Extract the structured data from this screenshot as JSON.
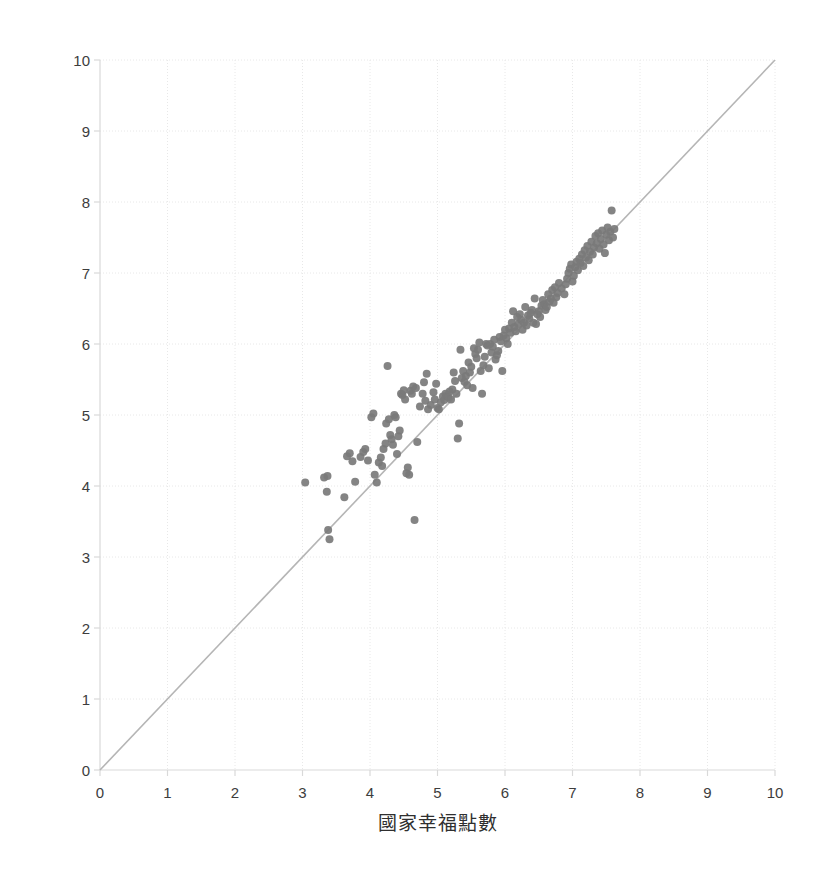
{
  "chart_data": {
    "type": "scatter",
    "title": "",
    "xlabel": "國家幸福點數",
    "ylabel": "都市幸福點數",
    "xlim": [
      0,
      10
    ],
    "ylim": [
      0,
      10
    ],
    "xticks": [
      "0",
      "1",
      "2",
      "3",
      "4",
      "5",
      "6",
      "7",
      "8",
      "9",
      "10"
    ],
    "yticks": [
      "0",
      "1",
      "2",
      "3",
      "4",
      "5",
      "6",
      "7",
      "8",
      "9",
      "10"
    ],
    "grid": true,
    "legend": null,
    "marker_color": "#7a7a7a",
    "marker_size": 8,
    "gridline_color": "#e8e8e8",
    "axis_color": "#d9d9d9",
    "reference_line": {
      "name": "y = x identity line",
      "color": "#b5b5b5",
      "from": [
        0,
        0
      ],
      "to": [
        10,
        10
      ]
    },
    "series": [
      {
        "name": "city vs country happiness",
        "points": [
          [
            3.04,
            4.05
          ],
          [
            3.32,
            4.12
          ],
          [
            3.36,
            3.92
          ],
          [
            3.38,
            3.38
          ],
          [
            3.4,
            3.25
          ],
          [
            3.37,
            4.14
          ],
          [
            3.62,
            3.84
          ],
          [
            3.66,
            4.42
          ],
          [
            3.7,
            4.46
          ],
          [
            3.74,
            4.35
          ],
          [
            3.78,
            4.06
          ],
          [
            3.86,
            4.41
          ],
          [
            3.9,
            4.48
          ],
          [
            3.93,
            4.52
          ],
          [
            3.97,
            4.36
          ],
          [
            4.02,
            4.97
          ],
          [
            4.05,
            5.02
          ],
          [
            4.07,
            4.16
          ],
          [
            4.1,
            4.05
          ],
          [
            4.13,
            4.33
          ],
          [
            4.16,
            4.4
          ],
          [
            4.18,
            4.28
          ],
          [
            4.2,
            4.52
          ],
          [
            4.23,
            4.6
          ],
          [
            4.24,
            4.88
          ],
          [
            4.26,
            5.69
          ],
          [
            4.28,
            4.94
          ],
          [
            4.3,
            4.72
          ],
          [
            4.32,
            4.66
          ],
          [
            4.34,
            4.58
          ],
          [
            4.36,
            5.0
          ],
          [
            4.38,
            4.97
          ],
          [
            4.4,
            4.45
          ],
          [
            4.42,
            4.7
          ],
          [
            4.44,
            4.78
          ],
          [
            4.46,
            5.3
          ],
          [
            4.48,
            5.28
          ],
          [
            4.5,
            5.35
          ],
          [
            4.52,
            5.22
          ],
          [
            4.54,
            4.18
          ],
          [
            4.56,
            4.26
          ],
          [
            4.58,
            4.16
          ],
          [
            4.6,
            5.34
          ],
          [
            4.62,
            5.3
          ],
          [
            4.64,
            5.4
          ],
          [
            4.66,
            3.52
          ],
          [
            4.68,
            5.38
          ],
          [
            4.7,
            4.62
          ],
          [
            4.74,
            5.12
          ],
          [
            4.78,
            5.3
          ],
          [
            4.8,
            5.46
          ],
          [
            4.82,
            5.2
          ],
          [
            4.84,
            5.58
          ],
          [
            4.86,
            5.08
          ],
          [
            4.9,
            5.14
          ],
          [
            4.94,
            5.32
          ],
          [
            4.96,
            5.22
          ],
          [
            4.98,
            5.44
          ],
          [
            5.0,
            5.1
          ],
          [
            5.02,
            5.08
          ],
          [
            5.05,
            5.18
          ],
          [
            5.08,
            5.26
          ],
          [
            5.1,
            5.21
          ],
          [
            5.12,
            5.3
          ],
          [
            5.14,
            5.27
          ],
          [
            5.16,
            5.25
          ],
          [
            5.18,
            5.33
          ],
          [
            5.2,
            5.22
          ],
          [
            5.22,
            5.36
          ],
          [
            5.24,
            5.6
          ],
          [
            5.26,
            5.48
          ],
          [
            5.28,
            5.3
          ],
          [
            5.3,
            4.67
          ],
          [
            5.32,
            4.88
          ],
          [
            5.34,
            5.92
          ],
          [
            5.36,
            5.52
          ],
          [
            5.38,
            5.62
          ],
          [
            5.4,
            5.47
          ],
          [
            5.42,
            5.55
          ],
          [
            5.44,
            5.42
          ],
          [
            5.46,
            5.74
          ],
          [
            5.48,
            5.6
          ],
          [
            5.5,
            5.68
          ],
          [
            5.52,
            5.38
          ],
          [
            5.54,
            5.94
          ],
          [
            5.56,
            5.86
          ],
          [
            5.58,
            5.8
          ],
          [
            5.6,
            5.92
          ],
          [
            5.62,
            6.02
          ],
          [
            5.64,
            5.62
          ],
          [
            5.66,
            5.3
          ],
          [
            5.68,
            5.7
          ],
          [
            5.7,
            5.82
          ],
          [
            5.72,
            6.0
          ],
          [
            5.74,
            5.98
          ],
          [
            5.76,
            5.66
          ],
          [
            5.78,
            6.0
          ],
          [
            5.8,
            5.88
          ],
          [
            5.82,
            5.96
          ],
          [
            5.84,
            6.06
          ],
          [
            5.86,
            5.78
          ],
          [
            5.88,
            5.84
          ],
          [
            5.9,
            5.9
          ],
          [
            5.92,
            6.1
          ],
          [
            5.94,
            6.04
          ],
          [
            5.96,
            5.62
          ],
          [
            5.98,
            6.12
          ],
          [
            6.0,
            6.2
          ],
          [
            6.02,
            6.08
          ],
          [
            6.04,
            6.0
          ],
          [
            6.06,
            6.22
          ],
          [
            6.08,
            6.16
          ],
          [
            6.1,
            6.3
          ],
          [
            6.12,
            6.46
          ],
          [
            6.14,
            6.24
          ],
          [
            6.16,
            6.18
          ],
          [
            6.18,
            6.38
          ],
          [
            6.2,
            6.28
          ],
          [
            6.22,
            6.42
          ],
          [
            6.24,
            6.34
          ],
          [
            6.26,
            6.2
          ],
          [
            6.28,
            6.3
          ],
          [
            6.3,
            6.52
          ],
          [
            6.32,
            6.26
          ],
          [
            6.34,
            6.4
          ],
          [
            6.36,
            6.36
          ],
          [
            6.38,
            6.44
          ],
          [
            6.4,
            6.48
          ],
          [
            6.42,
            6.3
          ],
          [
            6.44,
            6.64
          ],
          [
            6.46,
            6.28
          ],
          [
            6.48,
            6.42
          ],
          [
            6.5,
            6.46
          ],
          [
            6.52,
            6.38
          ],
          [
            6.54,
            6.54
          ],
          [
            6.56,
            6.62
          ],
          [
            6.58,
            6.56
          ],
          [
            6.6,
            6.48
          ],
          [
            6.62,
            6.52
          ],
          [
            6.64,
            6.7
          ],
          [
            6.66,
            6.6
          ],
          [
            6.68,
            6.64
          ],
          [
            6.7,
            6.76
          ],
          [
            6.72,
            6.58
          ],
          [
            6.74,
            6.8
          ],
          [
            6.76,
            6.66
          ],
          [
            6.78,
            6.72
          ],
          [
            6.8,
            6.86
          ],
          [
            6.84,
            6.78
          ],
          [
            6.88,
            6.7
          ],
          [
            6.9,
            6.84
          ],
          [
            6.92,
            6.92
          ],
          [
            6.94,
            7.0
          ],
          [
            6.96,
            7.06
          ],
          [
            6.98,
            7.12
          ],
          [
            7.0,
            6.88
          ],
          [
            7.02,
            6.96
          ],
          [
            7.04,
            7.08
          ],
          [
            7.06,
            7.16
          ],
          [
            7.08,
            7.04
          ],
          [
            7.1,
            7.2
          ],
          [
            7.12,
            7.14
          ],
          [
            7.14,
            7.26
          ],
          [
            7.16,
            7.1
          ],
          [
            7.18,
            7.32
          ],
          [
            7.2,
            7.22
          ],
          [
            7.22,
            7.38
          ],
          [
            7.24,
            7.18
          ],
          [
            7.26,
            7.3
          ],
          [
            7.28,
            7.44
          ],
          [
            7.3,
            7.26
          ],
          [
            7.32,
            7.36
          ],
          [
            7.34,
            7.52
          ],
          [
            7.36,
            7.42
          ],
          [
            7.38,
            7.56
          ],
          [
            7.4,
            7.34
          ],
          [
            7.42,
            7.48
          ],
          [
            7.44,
            7.6
          ],
          [
            7.46,
            7.4
          ],
          [
            7.48,
            7.28
          ],
          [
            7.5,
            7.54
          ],
          [
            7.52,
            7.64
          ],
          [
            7.54,
            7.46
          ],
          [
            7.56,
            7.58
          ],
          [
            7.58,
            7.88
          ],
          [
            7.6,
            7.5
          ],
          [
            7.62,
            7.62
          ]
        ]
      }
    ]
  }
}
